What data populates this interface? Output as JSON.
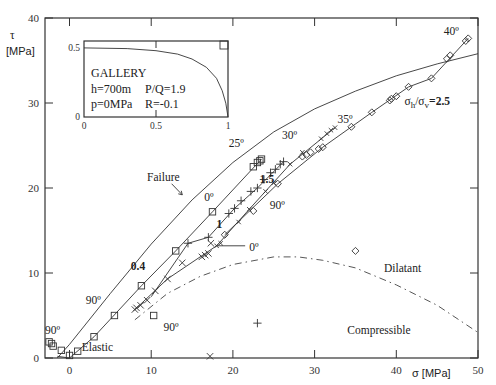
{
  "chart_data": {
    "type": "scatter",
    "title": "",
    "xlabel": "σ [MPa]",
    "ylabel": "τ [MPa]",
    "xlim": [
      -3,
      50
    ],
    "ylim": [
      0,
      40
    ],
    "x_ticks": [
      0,
      10,
      20,
      30,
      40,
      50
    ],
    "y_ticks": [
      0,
      10,
      20,
      30,
      40
    ],
    "grid": false,
    "curves": [
      {
        "name": "Failure",
        "style": "solid",
        "points": [
          [
            -1.5,
            0
          ],
          [
            0,
            1.6
          ],
          [
            5,
            7.6
          ],
          [
            10,
            13.4
          ],
          [
            15,
            18.6
          ],
          [
            20,
            23
          ],
          [
            25,
            26.6
          ],
          [
            30,
            29.3
          ],
          [
            35,
            31.4
          ],
          [
            40,
            33.2
          ],
          [
            45,
            34.6
          ],
          [
            50,
            35.8
          ]
        ]
      },
      {
        "name": "Dilatant/Compressible boundary",
        "style": "dash-dot",
        "points": [
          [
            8,
            4.5
          ],
          [
            12,
            7.6
          ],
          [
            16,
            9.6
          ],
          [
            20,
            11
          ],
          [
            25,
            11.9
          ],
          [
            28,
            11.9
          ],
          [
            31,
            11.5
          ],
          [
            35,
            10.6
          ],
          [
            40,
            8.6
          ],
          [
            45,
            6.2
          ],
          [
            50,
            3
          ]
        ]
      }
    ],
    "series": [
      {
        "name": "σh/σv=0.4",
        "marker": "square",
        "points": [
          [
            -2.5,
            1.9
          ],
          [
            -2.2,
            1.7
          ],
          [
            -2,
            1.4
          ],
          [
            -1,
            0.9
          ],
          [
            0,
            0.3
          ],
          [
            1,
            0.8
          ],
          [
            3,
            2.5
          ],
          [
            5.5,
            5
          ],
          [
            8.8,
            8.5
          ],
          [
            10.3,
            5
          ],
          [
            13,
            12.6
          ],
          [
            17.5,
            17.2
          ],
          [
            22.5,
            22.5
          ],
          [
            23,
            23
          ],
          [
            23.3,
            23.2
          ],
          [
            23.5,
            23.4
          ]
        ]
      },
      {
        "name": "σh/σv=1",
        "marker": "plus",
        "points": [
          [
            14.5,
            13.5
          ],
          [
            17,
            14.2
          ],
          [
            19.5,
            17
          ],
          [
            20.2,
            17.6
          ],
          [
            21,
            18.5
          ],
          [
            22.2,
            19.6
          ],
          [
            23,
            20
          ],
          [
            23.8,
            21
          ],
          [
            24.6,
            21.8
          ],
          [
            25.2,
            22.2
          ],
          [
            25.8,
            22.8
          ],
          [
            26.2,
            23.1
          ],
          [
            23,
            4.1
          ]
        ]
      },
      {
        "name": "σh/σv=1 (low)",
        "marker": "cross",
        "points": [
          [
            8,
            5.7
          ],
          [
            8.2,
            5.9
          ],
          [
            8.7,
            6.2
          ],
          [
            9.5,
            6.8
          ],
          [
            10.5,
            7.9
          ],
          [
            12,
            9.3
          ],
          [
            13.8,
            11.2
          ],
          [
            16.2,
            11.9
          ],
          [
            16.6,
            12.1
          ],
          [
            17,
            12.3
          ],
          [
            17.3,
            13.5
          ],
          [
            17.2,
            0.2
          ]
        ]
      },
      {
        "name": "σh/σv=1.5",
        "marker": "x",
        "points": [
          [
            18,
            13.2
          ],
          [
            18.5,
            13.5
          ],
          [
            20.7,
            16
          ],
          [
            22,
            17.5
          ],
          [
            24,
            19.6
          ],
          [
            25,
            20.6
          ],
          [
            27,
            22.8
          ],
          [
            28.5,
            24.2
          ],
          [
            30.8,
            25.8
          ],
          [
            31.5,
            26.4
          ],
          [
            32,
            26.8
          ],
          [
            32.5,
            27.1
          ]
        ]
      },
      {
        "name": "σh/σv=2.5",
        "marker": "diamond",
        "points": [
          [
            19,
            14.5
          ],
          [
            22.5,
            17.3
          ],
          [
            25.5,
            20.5
          ],
          [
            28.5,
            23.7
          ],
          [
            29,
            23.9
          ],
          [
            29.5,
            24.2
          ],
          [
            30.5,
            24.6
          ],
          [
            31,
            24.8
          ],
          [
            34.5,
            27.2
          ],
          [
            37,
            28.9
          ],
          [
            39.2,
            30.3
          ],
          [
            39.4,
            30.5
          ],
          [
            40,
            30.8
          ],
          [
            41.5,
            31.9
          ],
          [
            44.3,
            32.9
          ],
          [
            46.2,
            35.2
          ],
          [
            46.6,
            35.6
          ],
          [
            48.5,
            37.3
          ],
          [
            48.8,
            37.6
          ],
          [
            35,
            12.6
          ]
        ]
      }
    ],
    "annotations": [
      {
        "text": "90º",
        "x": -3,
        "y": 2.8
      },
      {
        "text": "90º",
        "x": 2,
        "y": 6.3
      },
      {
        "text": "90º",
        "x": 11.5,
        "y": 3.2
      },
      {
        "text": "90º",
        "x": 24.5,
        "y": 17.5
      },
      {
        "text": "0º",
        "x": 16.5,
        "y": 18.5
      },
      {
        "text": "0º",
        "x": 22,
        "y": 12.6
      },
      {
        "text": "25º",
        "x": 19.5,
        "y": 24.8
      },
      {
        "text": "30º",
        "x": 26,
        "y": 25.8
      },
      {
        "text": "35º",
        "x": 32.8,
        "y": 27.6
      },
      {
        "text": "40º",
        "x": 45.8,
        "y": 38
      },
      {
        "text": "0.4",
        "x": 7.5,
        "y": 10.4
      },
      {
        "text": "1",
        "x": 18,
        "y": 15.3
      },
      {
        "text": "1.5",
        "x": 23.3,
        "y": 20.6
      },
      {
        "text": "σh/σv=2.5",
        "x": 41,
        "y": 29.8
      },
      {
        "text": "Failure",
        "x": 9.5,
        "y": 20.8
      },
      {
        "text": "Dilatant",
        "x": 38.5,
        "y": 10.1
      },
      {
        "text": "Compressible",
        "x": 34,
        "y": 2.8
      },
      {
        "text": "Elastic",
        "x": 1.5,
        "y": 0.8
      }
    ],
    "inset": {
      "title": "GALLERY",
      "lines": [
        "h=700m",
        "p=0MPa",
        "P/Q=1.9",
        "R=-0.1"
      ],
      "xlim": [
        0,
        1
      ],
      "ylim": [
        0,
        0.55
      ],
      "x_ticks": [
        "0",
        "0.5",
        "1"
      ],
      "y_ticks": [
        "0",
        "0.5"
      ],
      "curve": [
        [
          0,
          0.5
        ],
        [
          0.3,
          0.495
        ],
        [
          0.5,
          0.48
        ],
        [
          0.65,
          0.455
        ],
        [
          0.75,
          0.42
        ],
        [
          0.85,
          0.36
        ],
        [
          0.92,
          0.28
        ],
        [
          0.96,
          0.19
        ],
        [
          0.985,
          0.1
        ],
        [
          1,
          0
        ]
      ]
    }
  },
  "axes": {
    "x_title": "σ [MPa]",
    "y_title_symbol": "τ",
    "y_title_unit": "[MPa]"
  },
  "inset_labels": {
    "title": "GALLERY",
    "depth": "h=700m",
    "pressure": "p=0MPa",
    "ratio": "P/Q=1.9",
    "r_value": "R=-0.1"
  }
}
